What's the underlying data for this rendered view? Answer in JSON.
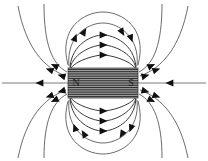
{
  "figure": {
    "background_color": "#ffffff",
    "width": 208,
    "height": 161
  },
  "magnet": {
    "name": "bar-magnet",
    "x": 68,
    "y": 68,
    "width": 70,
    "height": 30,
    "fill_color": "#9a9a9a",
    "stripe_color": "#1a1a1a",
    "stripe_count": 13,
    "north_label": "N",
    "south_label": "S",
    "north_label_x": 76,
    "south_label_x": 131,
    "label_y": 86
  },
  "field": {
    "line_color": "#5a5a5a",
    "inner_line_color": "#3a3a3a",
    "arrow_color": "#111111",
    "axis_color": "#7a7a7a",
    "direction": "north-to-south",
    "description": "Closed dipole field loops emerging from the N pole and entering the S pole"
  },
  "chart_data": {
    "type": "line",
    "xlabel": "",
    "ylabel": "",
    "xlim": [
      0,
      208
    ],
    "ylim": [
      0,
      161
    ],
    "grid": false,
    "legend": null,
    "annotations": [
      {
        "text": "N",
        "x": 76,
        "y": 86
      },
      {
        "text": "S",
        "x": 131,
        "y": 86
      }
    ],
    "series": [
      {
        "name": "axis-line-left",
        "path": "M 2 83 L 68 83",
        "arrows": [
          {
            "x": 40,
            "y": 83,
            "angle": 180
          }
        ],
        "class": "axisline"
      },
      {
        "name": "axis-line-right",
        "path": "M 138 83 L 206 83",
        "arrows": [
          {
            "x": 170,
            "y": 83,
            "angle": 180
          }
        ],
        "class": "axisline"
      },
      {
        "name": "loop-top-1",
        "path": "M 70 69 C 76 60 96 55 103 55 C 110 55 130 60 136 69",
        "arrows": [
          {
            "x": 103,
            "y": 55,
            "angle": 0
          }
        ],
        "class": "fieldline inner"
      },
      {
        "name": "loop-top-2",
        "path": "M 70 68 C 74 52 94 45 103 45 C 112 45 132 52 136 68",
        "arrows": [
          {
            "x": 103,
            "y": 45,
            "angle": 0
          }
        ],
        "class": "fieldline inner"
      },
      {
        "name": "loop-top-3",
        "path": "M 70 67 C 72 44 92 35 103 35 C 114 35 134 44 136 67",
        "arrows": [
          {
            "x": 103,
            "y": 35,
            "angle": 0
          }
        ],
        "class": "fieldline inner"
      },
      {
        "name": "loop-top-4",
        "path": "M 69 66 C 66 36 88 23 103 23 C 118 23 140 36 137 66",
        "arrows": [
          {
            "x": 84,
            "y": 32,
            "angle": 300
          },
          {
            "x": 122,
            "y": 32,
            "angle": 60
          }
        ],
        "class": "fieldline"
      },
      {
        "name": "loop-top-5",
        "path": "M 68 65 C 58 28 84 12 103 12 C 122 12 148 28 138 65",
        "arrows": [
          {
            "x": 75,
            "y": 38,
            "angle": 290
          },
          {
            "x": 131,
            "y": 38,
            "angle": 70
          }
        ],
        "class": "fieldline"
      },
      {
        "name": "loop-bottom-1",
        "path": "M 70 97 C 76 106 96 111 103 111 C 110 111 130 106 136 97",
        "arrows": [
          {
            "x": 103,
            "y": 111,
            "angle": 0
          }
        ],
        "class": "fieldline inner"
      },
      {
        "name": "loop-bottom-2",
        "path": "M 70 98 C 74 114 94 121 103 121 C 112 121 132 114 136 98",
        "arrows": [
          {
            "x": 103,
            "y": 121,
            "angle": 0
          }
        ],
        "class": "fieldline inner"
      },
      {
        "name": "loop-bottom-3",
        "path": "M 70 99 C 72 122 92 131 103 131 C 114 131 134 122 136 99",
        "arrows": [
          {
            "x": 103,
            "y": 131,
            "angle": 0
          }
        ],
        "class": "fieldline inner"
      },
      {
        "name": "loop-bottom-4",
        "path": "M 69 100 C 66 130 88 143 103 143 C 118 143 140 130 137 100",
        "arrows": [
          {
            "x": 84,
            "y": 134,
            "angle": 240
          },
          {
            "x": 122,
            "y": 134,
            "angle": 120
          }
        ],
        "class": "fieldline"
      },
      {
        "name": "loop-bottom-5",
        "path": "M 68 101 C 58 138 84 154 103 154 C 122 154 148 138 138 101",
        "arrows": [
          {
            "x": 75,
            "y": 128,
            "angle": 250
          },
          {
            "x": 131,
            "y": 128,
            "angle": 110
          }
        ],
        "class": "fieldline"
      },
      {
        "name": "outer-upper-left-near",
        "path": "M 67 72 C 52 64 44 44 44 4",
        "arrows": [
          {
            "x": 55,
            "y": 66,
            "angle": 205
          }
        ],
        "class": "fieldline"
      },
      {
        "name": "outer-upper-left-far",
        "path": "M 66 76 C 44 68 26 48 18 6",
        "arrows": [
          {
            "x": 50,
            "y": 70,
            "angle": 200
          }
        ],
        "class": "fieldline"
      },
      {
        "name": "outer-lower-left-near",
        "path": "M 67 94 C 52 102 44 122 44 158",
        "arrows": [
          {
            "x": 55,
            "y": 100,
            "angle": 155
          }
        ],
        "class": "fieldline"
      },
      {
        "name": "outer-lower-left-far",
        "path": "M 66 90 C 44 98 26 118 18 158",
        "arrows": [
          {
            "x": 50,
            "y": 96,
            "angle": 160
          }
        ],
        "class": "fieldline"
      },
      {
        "name": "outer-upper-right-near",
        "path": "M 162 4 C 162 44 154 64 139 72",
        "arrows": [
          {
            "x": 151,
            "y": 66,
            "angle": 335
          }
        ],
        "class": "fieldline"
      },
      {
        "name": "outer-upper-right-far",
        "path": "M 188 6 C 180 48 162 68 140 76",
        "arrows": [
          {
            "x": 156,
            "y": 70,
            "angle": 340
          }
        ],
        "class": "fieldline"
      },
      {
        "name": "outer-lower-right-near",
        "path": "M 162 158 C 162 122 154 102 139 94",
        "arrows": [
          {
            "x": 151,
            "y": 100,
            "angle": 25
          }
        ],
        "class": "fieldline"
      },
      {
        "name": "outer-lower-right-far",
        "path": "M 188 158 C 180 118 162 98 140 90",
        "arrows": [
          {
            "x": 156,
            "y": 96,
            "angle": 20
          }
        ],
        "class": "fieldline"
      },
      {
        "name": "pole-arrow-left-upper-a",
        "path": "",
        "arrows": [
          {
            "x": 62,
            "y": 76,
            "angle": 195
          }
        ],
        "class": "arrow-only"
      },
      {
        "name": "pole-arrow-left-lower-a",
        "path": "",
        "arrows": [
          {
            "x": 62,
            "y": 91,
            "angle": 165
          }
        ],
        "class": "arrow-only"
      },
      {
        "name": "pole-arrow-right-upper-a",
        "path": "",
        "arrows": [
          {
            "x": 145,
            "y": 76,
            "angle": 345
          }
        ],
        "class": "arrow-only"
      },
      {
        "name": "pole-arrow-right-lower-a",
        "path": "",
        "arrows": [
          {
            "x": 145,
            "y": 91,
            "angle": 15
          }
        ],
        "class": "arrow-only"
      }
    ]
  }
}
